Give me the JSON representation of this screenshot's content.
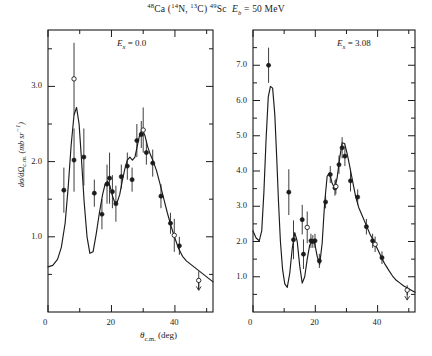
{
  "figure": {
    "title_parts": {
      "target_mass": "48",
      "target": "Ca",
      "projectile_mass": "14",
      "projectile": "N",
      "ejectile_mass": "13",
      "ejectile": "C",
      "residual_mass": "49",
      "residual": "Sc",
      "energy_symbol": "E",
      "energy_sub": "b",
      "energy_value": "= 50 MeV"
    },
    "title_plain": "48Ca (14N, 13C) 49Sc  Eb = 50 MeV",
    "ylabel": "dσ/dΩ",
    "ylabel_sub": "c.m.",
    "ylabel_units": "(mb sr",
    "ylabel_units_sup": "−1",
    "ylabel_units_end": ")",
    "xlabel": "θ",
    "xlabel_sub": "c.m.",
    "xlabel_units": "(deg)"
  },
  "chart_data": [
    {
      "type": "scatter",
      "panel": "left",
      "title": "",
      "annotation": "E",
      "annotation_sub": "x",
      "annotation_value": "= 0.0",
      "xlabel": "θc.m. (deg)",
      "ylabel": "dσ/dΩc.m. (mb sr−1)",
      "xlim": [
        0,
        52
      ],
      "ylim": [
        0,
        3.75
      ],
      "xticks_major": [
        0,
        20,
        40
      ],
      "xticks_minor": [
        10,
        30,
        50
      ],
      "yticks_major": [
        1.0,
        2.0,
        3.0
      ],
      "yticks_minor": [
        0.5,
        1.5,
        2.5,
        3.5
      ],
      "grid": false,
      "legend": "none",
      "series": [
        {
          "name": "data-filled",
          "marker": "filled-circle",
          "points": [
            {
              "x": 5.0,
              "y": 1.62,
              "err": 0.3
            },
            {
              "x": 8.2,
              "y": 2.02,
              "err": 0.42
            },
            {
              "x": 11.3,
              "y": 2.06,
              "err": 0.38
            },
            {
              "x": 14.6,
              "y": 1.58,
              "err": 0.18
            },
            {
              "x": 17.0,
              "y": 1.3,
              "err": 0.2
            },
            {
              "x": 18.6,
              "y": 1.7,
              "err": 0.26
            },
            {
              "x": 19.4,
              "y": 1.78,
              "err": 0.34
            },
            {
              "x": 20.3,
              "y": 1.6,
              "err": 0.22
            },
            {
              "x": 21.4,
              "y": 1.44,
              "err": 0.24
            },
            {
              "x": 23.1,
              "y": 1.8,
              "err": 0.16
            },
            {
              "x": 25.0,
              "y": 1.94,
              "err": 0.18
            },
            {
              "x": 26.5,
              "y": 1.76,
              "err": 0.16
            },
            {
              "x": 28.0,
              "y": 2.28,
              "err": 0.22
            },
            {
              "x": 29.4,
              "y": 2.36,
              "err": 0.18
            },
            {
              "x": 31.0,
              "y": 2.12,
              "err": 0.16
            },
            {
              "x": 33.0,
              "y": 1.98,
              "err": 0.18
            },
            {
              "x": 35.6,
              "y": 1.54,
              "err": 0.16
            },
            {
              "x": 38.6,
              "y": 1.18,
              "err": 0.14
            },
            {
              "x": 41.4,
              "y": 0.88,
              "err": 0.12
            }
          ]
        },
        {
          "name": "data-open",
          "marker": "open-circle",
          "points": [
            {
              "x": 8.2,
              "y": 3.1,
              "err": 0.48
            },
            {
              "x": 30.0,
              "y": 2.42,
              "err": 0.3
            },
            {
              "x": 39.8,
              "y": 1.02,
              "err": 0.22
            }
          ]
        },
        {
          "name": "upper-limit",
          "marker": "open-circle-arrow",
          "points": [
            {
              "x": 47.5,
              "y": 0.42,
              "err": 0.12
            }
          ]
        },
        {
          "name": "dwba-curve",
          "marker": "line",
          "x": [
            0.0,
            1.5,
            3.0,
            4.2,
            5.4,
            6.4,
            7.3,
            8.2,
            9.0,
            9.8,
            10.6,
            11.4,
            12.3,
            13.2,
            14.2,
            15.2,
            16.2,
            17.2,
            18.0,
            18.8,
            19.5,
            20.2,
            21.0,
            21.8,
            22.6,
            23.4,
            24.2,
            25.0,
            25.8,
            26.6,
            27.4,
            28.2,
            29.0,
            29.8,
            30.6,
            31.4,
            32.2,
            33.2,
            34.2,
            35.2,
            36.4,
            37.6,
            38.8,
            40.0,
            41.2,
            42.4,
            43.6,
            44.8,
            46.0,
            47.2,
            48.4,
            49.6,
            50.8,
            52.0
          ],
          "y": [
            0.6,
            0.62,
            0.7,
            0.86,
            1.18,
            1.68,
            2.22,
            2.62,
            2.72,
            2.5,
            2.0,
            1.46,
            1.0,
            0.78,
            0.8,
            1.04,
            1.32,
            1.56,
            1.7,
            1.74,
            1.68,
            1.56,
            1.46,
            1.46,
            1.56,
            1.74,
            1.9,
            2.02,
            2.06,
            2.02,
            2.06,
            2.22,
            2.38,
            2.42,
            2.34,
            2.2,
            2.1,
            2.0,
            1.88,
            1.72,
            1.52,
            1.32,
            1.14,
            0.98,
            0.84,
            0.74,
            0.68,
            0.64,
            0.6,
            0.56,
            0.52,
            0.48,
            0.44,
            0.4
          ]
        }
      ]
    },
    {
      "type": "scatter",
      "panel": "right",
      "title": "",
      "annotation": "E",
      "annotation_sub": "x",
      "annotation_value": "= 3.08",
      "xlabel": "θc.m. (deg)",
      "ylabel": "dσ/dΩc.m. (mb sr−1)",
      "xlim": [
        0,
        52
      ],
      "ylim": [
        0,
        8.0
      ],
      "xticks_major": [
        0,
        20,
        40
      ],
      "xticks_minor": [
        10,
        30,
        50
      ],
      "yticks_major": [
        1.0,
        2.0,
        3.0,
        4.0,
        5.0,
        6.0,
        7.0
      ],
      "yticks_minor": [
        0.5,
        1.5,
        2.5,
        3.5,
        4.5,
        5.5,
        6.5,
        7.5
      ],
      "grid": false,
      "legend": "none",
      "series": [
        {
          "name": "data-filled",
          "marker": "filled-circle",
          "points": [
            {
              "x": 5.0,
              "y": 7.0,
              "err": 0.5
            },
            {
              "x": 11.5,
              "y": 3.4,
              "err": 0.65
            },
            {
              "x": 13.0,
              "y": 2.05,
              "err": 0.55
            },
            {
              "x": 15.8,
              "y": 2.62,
              "err": 0.42
            },
            {
              "x": 16.2,
              "y": 1.64,
              "err": 0.42
            },
            {
              "x": 18.6,
              "y": 2.02,
              "err": 0.2
            },
            {
              "x": 19.2,
              "y": 2.0,
              "err": 0.18
            },
            {
              "x": 19.9,
              "y": 2.02,
              "err": 0.2
            },
            {
              "x": 21.3,
              "y": 1.45,
              "err": 0.2
            },
            {
              "x": 23.3,
              "y": 3.12,
              "err": 0.18
            },
            {
              "x": 24.8,
              "y": 3.9,
              "err": 0.24
            },
            {
              "x": 26.3,
              "y": 3.52,
              "err": 0.22
            },
            {
              "x": 27.6,
              "y": 4.18,
              "err": 0.26
            },
            {
              "x": 28.6,
              "y": 4.66,
              "err": 0.3
            },
            {
              "x": 29.5,
              "y": 4.42,
              "err": 0.28
            },
            {
              "x": 31.3,
              "y": 3.72,
              "err": 0.3
            },
            {
              "x": 33.6,
              "y": 3.26,
              "err": 0.22
            },
            {
              "x": 36.4,
              "y": 2.42,
              "err": 0.22
            },
            {
              "x": 38.4,
              "y": 2.02,
              "err": 0.2
            },
            {
              "x": 41.4,
              "y": 1.54,
              "err": 0.18
            }
          ]
        },
        {
          "name": "data-open",
          "marker": "open-circle",
          "points": [
            {
              "x": 17.4,
              "y": 2.4,
              "err": 0.45
            },
            {
              "x": 26.6,
              "y": 3.56,
              "err": 0.22
            },
            {
              "x": 39.2,
              "y": 1.92,
              "err": 0.22
            }
          ]
        },
        {
          "name": "upper-limit",
          "marker": "open-circle-arrow",
          "points": [
            {
              "x": 49.5,
              "y": 0.62,
              "err": 0.14
            }
          ]
        },
        {
          "name": "dwba-curve",
          "marker": "line",
          "x": [
            0.0,
            1.0,
            2.0,
            2.8,
            3.5,
            4.2,
            4.9,
            5.6,
            6.3,
            7.0,
            7.6,
            8.2,
            8.8,
            9.5,
            10.2,
            11.0,
            11.8,
            12.6,
            13.4,
            14.2,
            15.0,
            15.8,
            16.6,
            17.4,
            18.2,
            19.0,
            19.8,
            20.6,
            21.4,
            22.2,
            23.0,
            23.8,
            24.6,
            25.4,
            26.2,
            27.0,
            27.8,
            28.6,
            29.4,
            30.2,
            31.0,
            32.0,
            33.0,
            34.0,
            35.2,
            36.4,
            37.6,
            38.8,
            40.0,
            41.2,
            42.4,
            43.6,
            44.8,
            46.0,
            47.2,
            48.4,
            49.6,
            50.8,
            52.0
          ],
          "y": [
            2.3,
            2.1,
            2.02,
            2.3,
            3.4,
            4.9,
            6.1,
            6.4,
            6.35,
            5.6,
            4.4,
            3.1,
            2.0,
            1.2,
            0.8,
            0.7,
            1.1,
            1.8,
            2.25,
            2.0,
            1.3,
            0.82,
            1.0,
            1.5,
            1.9,
            2.0,
            1.95,
            1.58,
            1.35,
            1.95,
            3.1,
            3.85,
            3.95,
            3.65,
            3.52,
            3.8,
            4.35,
            4.8,
            4.78,
            4.5,
            4.15,
            3.7,
            3.25,
            2.95,
            2.7,
            2.45,
            2.2,
            2.0,
            1.78,
            1.55,
            1.35,
            1.18,
            1.02,
            0.9,
            0.82,
            0.74,
            0.68,
            0.62,
            0.56
          ]
        }
      ]
    }
  ]
}
